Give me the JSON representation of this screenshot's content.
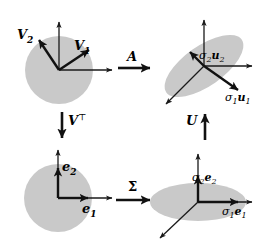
{
  "figure": {
    "background_color": "#ffffff",
    "shape_fill_color": "#c9c9c9",
    "stroke_color": "#1a1a1a"
  },
  "panels": {
    "top_left": {
      "name": "unit-disk-input",
      "shape": "circle",
      "axis_labels": [],
      "vectors": [
        {
          "label_plain": "V1",
          "base": "V",
          "sub": "1",
          "angle_deg": 33,
          "style": "bold"
        },
        {
          "label_plain": "V2",
          "base": "V",
          "sub": "2",
          "angle_deg": 117,
          "style": "bold"
        }
      ]
    },
    "top_right": {
      "name": "transformed-ellipse-output",
      "shape": "tilted-ellipse",
      "rotation_deg": -35,
      "vectors": [
        {
          "label_plain": "sigma1 u1",
          "sigma": "σ",
          "sigma_sub": "1",
          "vec": "u",
          "vec_sub": "1",
          "style": "bold"
        },
        {
          "label_plain": "sigma2 u2",
          "sigma": "σ",
          "sigma_sub": "2",
          "vec": "u",
          "vec_sub": "2",
          "style": "bold"
        }
      ]
    },
    "bottom_left": {
      "name": "rotated-unit-disk",
      "shape": "circle",
      "vectors": [
        {
          "label_plain": "e1",
          "base": "e",
          "sub": "1",
          "style": "bold"
        },
        {
          "label_plain": "e2",
          "base": "e",
          "sub": "2",
          "style": "bold"
        }
      ]
    },
    "bottom_right": {
      "name": "scaled-disk",
      "shape": "flat-ellipse",
      "vectors": [
        {
          "label_plain": "sigma1 e1",
          "sigma": "σ",
          "sigma_sub": "1",
          "vec": "e",
          "vec_sub": "1",
          "style": "bold"
        },
        {
          "label_plain": "sigma2 e2",
          "sigma": "σ",
          "sigma_sub": "2",
          "vec": "e",
          "vec_sub": "2",
          "style": "bold"
        }
      ]
    }
  },
  "operators": [
    {
      "name": "operator-A",
      "label": "A",
      "superscript": "",
      "direction": "right",
      "position": "top-middle"
    },
    {
      "name": "operator-V-transpose",
      "label": "V",
      "superscript": "⊤",
      "direction": "down",
      "position": "left-middle"
    },
    {
      "name": "operator-U",
      "label": "U",
      "superscript": "",
      "direction": "up",
      "position": "right-middle"
    },
    {
      "name": "operator-Sigma",
      "label": "Σ",
      "superscript": "",
      "direction": "right",
      "position": "bottom-middle"
    }
  ],
  "labels": {
    "v1": "V",
    "v1_sub": "1",
    "v2": "V",
    "v2_sub": "2",
    "e1": "e",
    "e1_sub": "1",
    "e2": "e",
    "e2_sub": "2",
    "sigma": "σ",
    "one": "1",
    "two": "2",
    "u": "u",
    "e": "e",
    "A": "A",
    "V": "V",
    "transpose": "⊤",
    "U": "U",
    "Sigma": "Σ"
  }
}
